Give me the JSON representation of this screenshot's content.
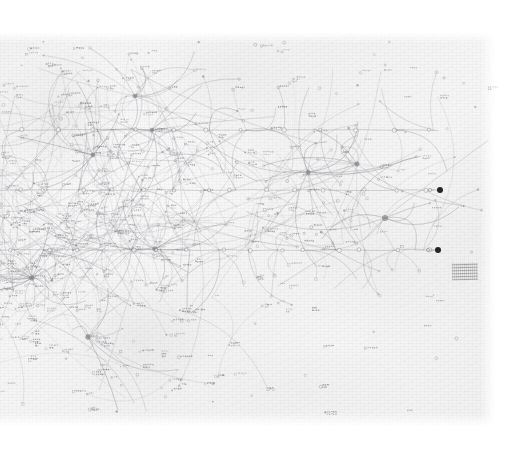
{
  "document": {
    "kind": "scanned-hand-drawn-diagram",
    "medium": "pencil on textured paper",
    "title_visible": "",
    "legible_text": "none — all annotations are too small/faint to read at this scan resolution"
  },
  "canvas": {
    "width": 519,
    "height": 450,
    "background": "#ffffff"
  },
  "paper": {
    "x": 0,
    "y": 33,
    "width": 494,
    "height": 392,
    "color": "#f4f4f5",
    "ink_color": "#6b6b72",
    "accent_color": "#141416"
  },
  "diagram": {
    "type": "node-link network (radial hairball)",
    "baselines": [
      {
        "name": "baseline-top",
        "y": 130,
        "x1": 4,
        "x2": 452,
        "node_count": 12
      },
      {
        "name": "baseline-middle",
        "y": 190,
        "x1": 0,
        "x2": 440,
        "node_count": 14,
        "terminal": "filled"
      },
      {
        "name": "baseline-bottom",
        "y": 250,
        "x1": 0,
        "x2": 438,
        "node_count": 15,
        "terminal": "filled"
      }
    ],
    "hubs": [
      {
        "name": "hub-primary-left",
        "x": 32,
        "y": 278,
        "degree": 26
      },
      {
        "name": "hub-upper-left",
        "x": 135,
        "y": 96,
        "degree": 11
      },
      {
        "name": "hub-upper-mid",
        "x": 152,
        "y": 130,
        "degree": 9
      },
      {
        "name": "hub-mid-left",
        "x": 93,
        "y": 155,
        "degree": 10
      },
      {
        "name": "hub-centre",
        "x": 155,
        "y": 249,
        "degree": 12
      },
      {
        "name": "hub-right",
        "x": 308,
        "y": 172,
        "degree": 13
      },
      {
        "name": "hub-right-lower",
        "x": 357,
        "y": 164,
        "degree": 8
      },
      {
        "name": "hub-far-right",
        "x": 385,
        "y": 218,
        "degree": 9
      },
      {
        "name": "hub-lower-centre",
        "x": 88,
        "y": 337,
        "degree": 10
      }
    ],
    "terminal_nodes": [
      {
        "name": "terminal-node-upper",
        "x": 440,
        "y": 190,
        "style": "filled-black",
        "radius": 3
      },
      {
        "name": "terminal-node-lower",
        "x": 438,
        "y": 250,
        "style": "filled-black",
        "radius": 3
      }
    ],
    "caption_block": {
      "x": 452,
      "y": 263,
      "width": 26,
      "height": 17,
      "text": "(illegible handwriting)"
    },
    "counts": {
      "nodes": 340,
      "edges": 520,
      "baselines": 3,
      "filled_terminals": 2
    }
  }
}
